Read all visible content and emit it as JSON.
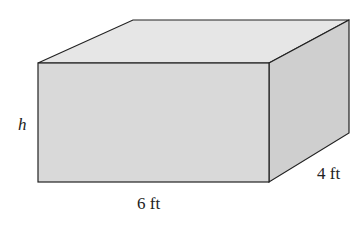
{
  "diagram": {
    "shape": "rectangular-prism",
    "labels": {
      "height": "h",
      "length": "6 ft",
      "depth": "4 ft"
    },
    "colors": {
      "front": "#d9d9d9",
      "top": "#e6e6e6",
      "side": "#cdcdcd",
      "edge": "#222222"
    }
  }
}
